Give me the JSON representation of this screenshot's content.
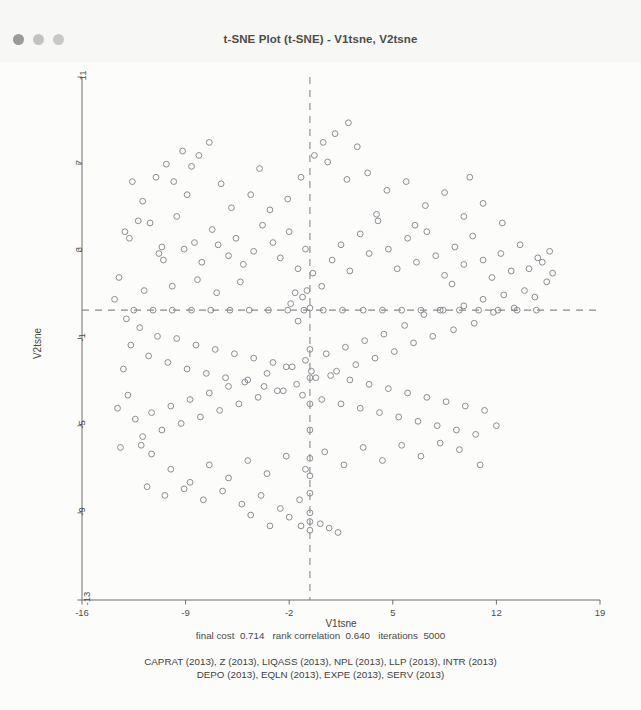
{
  "window": {
    "title": "t-SNE Plot (t-SNE) - V1tsne, V2tsne",
    "traffic_lights": [
      "close",
      "minimize",
      "zoom"
    ]
  },
  "chart_data": {
    "type": "scatter",
    "title": "t-SNE Plot (t-SNE) - V1tsne, V2tsne",
    "xlabel": "V1tsne",
    "ylabel": "V2tsne",
    "xlim": [
      -16,
      19
    ],
    "ylim": [
      -13,
      11
    ],
    "xticks": [
      -16,
      -9,
      -2,
      5,
      12,
      19
    ],
    "yticks": [
      -13,
      -9,
      -5,
      -1,
      3,
      7,
      11
    ],
    "xtick_labels": [
      "-16",
      "-9",
      "-2",
      "5",
      "12",
      "19"
    ],
    "ytick_labels": [
      "-13",
      "-9",
      "-5",
      "-1",
      "3",
      "7",
      "11"
    ],
    "grid": false,
    "legend": "none",
    "marker": "open-circle",
    "marker_color": "#8d8d94",
    "marker_size": 4.6,
    "reference_lines": [
      {
        "orientation": "vertical",
        "value": -0.6,
        "style": "dashed",
        "color": "#8a8a8a"
      },
      {
        "orientation": "horizontal",
        "value": 0.3,
        "style": "dashed",
        "color": "#8a8a8a"
      }
    ],
    "points": [
      [
        -12.6,
        6.2
      ],
      [
        -11.9,
        5.3
      ],
      [
        -12.2,
        4.4
      ],
      [
        -11.4,
        4.3
      ],
      [
        -13.1,
        3.9
      ],
      [
        -12.8,
        3.6
      ],
      [
        -11.0,
        6.4
      ],
      [
        -10.3,
        7.0
      ],
      [
        -9.8,
        6.2
      ],
      [
        -9.2,
        7.6
      ],
      [
        -8.6,
        6.9
      ],
      [
        -8.1,
        7.4
      ],
      [
        -7.4,
        8.0
      ],
      [
        -8.9,
        5.6
      ],
      [
        -9.6,
        4.6
      ],
      [
        -10.6,
        3.2
      ],
      [
        -10.8,
        2.9
      ],
      [
        -10.5,
        2.6
      ],
      [
        -9.1,
        3.1
      ],
      [
        -8.4,
        3.4
      ],
      [
        -7.9,
        2.5
      ],
      [
        -7.2,
        4.0
      ],
      [
        -6.8,
        3.3
      ],
      [
        -6.1,
        2.8
      ],
      [
        -5.6,
        3.6
      ],
      [
        -5.1,
        2.4
      ],
      [
        -4.4,
        3.0
      ],
      [
        -3.8,
        4.2
      ],
      [
        -3.1,
        3.4
      ],
      [
        -2.6,
        2.7
      ],
      [
        -2.0,
        3.9
      ],
      [
        -1.4,
        2.2
      ],
      [
        -0.9,
        3.1
      ],
      [
        -0.6,
        0.4
      ],
      [
        -0.8,
        1.2
      ],
      [
        -1.1,
        0.9
      ],
      [
        -1.6,
        1.1
      ],
      [
        -1.9,
        0.6
      ],
      [
        -0.4,
        2.0
      ],
      [
        0.2,
        1.4
      ],
      [
        0.9,
        2.6
      ],
      [
        1.5,
        3.3
      ],
      [
        2.1,
        2.1
      ],
      [
        2.8,
        3.8
      ],
      [
        3.4,
        2.9
      ],
      [
        4.0,
        4.4
      ],
      [
        4.7,
        3.1
      ],
      [
        5.3,
        2.2
      ],
      [
        6.0,
        3.6
      ],
      [
        6.6,
        2.5
      ],
      [
        7.3,
        3.9
      ],
      [
        7.9,
        2.8
      ],
      [
        8.5,
        1.9
      ],
      [
        9.2,
        3.2
      ],
      [
        9.8,
        2.4
      ],
      [
        10.4,
        3.7
      ],
      [
        11.1,
        2.6
      ],
      [
        11.7,
        1.8
      ],
      [
        12.3,
        2.9
      ],
      [
        13.0,
        2.1
      ],
      [
        13.6,
        3.3
      ],
      [
        14.2,
        2.2
      ],
      [
        14.8,
        2.7
      ],
      [
        15.1,
        2.5
      ],
      [
        15.4,
        1.6
      ],
      [
        14.6,
        0.9
      ],
      [
        13.9,
        1.2
      ],
      [
        13.2,
        0.4
      ],
      [
        12.5,
        1.0
      ],
      [
        11.8,
        0.2
      ],
      [
        11.1,
        0.8
      ],
      [
        10.5,
        -0.3
      ],
      [
        9.8,
        0.5
      ],
      [
        9.1,
        -0.6
      ],
      [
        8.4,
        0.3
      ],
      [
        7.7,
        -0.9
      ],
      [
        7.1,
        0.1
      ],
      [
        6.4,
        -1.2
      ],
      [
        5.8,
        -0.4
      ],
      [
        5.1,
        -1.6
      ],
      [
        4.4,
        -0.8
      ],
      [
        3.8,
        -1.9
      ],
      [
        3.1,
        -1.1
      ],
      [
        2.5,
        -2.2
      ],
      [
        1.8,
        -1.4
      ],
      [
        1.2,
        -2.5
      ],
      [
        0.5,
        -1.7
      ],
      [
        -0.2,
        -2.8
      ],
      [
        -0.9,
        -2.0
      ],
      [
        -1.5,
        -3.1
      ],
      [
        -2.2,
        -2.3
      ],
      [
        -2.8,
        -3.4
      ],
      [
        -3.5,
        -2.6
      ],
      [
        -4.1,
        -3.7
      ],
      [
        -4.8,
        -2.9
      ],
      [
        -5.4,
        -4.0
      ],
      [
        -6.1,
        -3.2
      ],
      [
        -6.7,
        -4.3
      ],
      [
        -7.4,
        -3.5
      ],
      [
        -8.0,
        -4.6
      ],
      [
        -8.7,
        -3.8
      ],
      [
        -9.3,
        -4.9
      ],
      [
        -10.0,
        -4.1
      ],
      [
        -10.6,
        -5.2
      ],
      [
        -11.3,
        -4.4
      ],
      [
        -11.9,
        -5.5
      ],
      [
        -12.4,
        -4.7
      ],
      [
        -12.9,
        -3.6
      ],
      [
        -13.2,
        -2.4
      ],
      [
        -12.7,
        -1.3
      ],
      [
        -12.1,
        -0.5
      ],
      [
        -11.5,
        -1.8
      ],
      [
        -10.9,
        -0.9
      ],
      [
        -10.2,
        -2.1
      ],
      [
        -9.6,
        -1.0
      ],
      [
        -8.9,
        -2.4
      ],
      [
        -8.3,
        -1.3
      ],
      [
        -7.6,
        -2.6
      ],
      [
        -7.0,
        -1.5
      ],
      [
        -6.3,
        -2.8
      ],
      [
        -5.7,
        -1.7
      ],
      [
        -5.0,
        -3.0
      ],
      [
        -4.4,
        -1.9
      ],
      [
        -3.7,
        -3.2
      ],
      [
        -3.1,
        -2.1
      ],
      [
        -2.4,
        -3.4
      ],
      [
        -1.8,
        -2.3
      ],
      [
        -1.1,
        -3.6
      ],
      [
        -0.5,
        -2.5
      ],
      [
        0.2,
        -3.8
      ],
      [
        0.8,
        -2.7
      ],
      [
        1.5,
        -4.0
      ],
      [
        2.1,
        -2.9
      ],
      [
        2.8,
        -4.2
      ],
      [
        3.4,
        -3.1
      ],
      [
        4.1,
        -4.4
      ],
      [
        4.7,
        -3.3
      ],
      [
        5.4,
        -4.6
      ],
      [
        6.0,
        -3.5
      ],
      [
        6.7,
        -4.8
      ],
      [
        7.3,
        -3.7
      ],
      [
        8.0,
        -5.0
      ],
      [
        8.6,
        -3.9
      ],
      [
        9.3,
        -5.2
      ],
      [
        9.9,
        -4.1
      ],
      [
        10.6,
        -5.4
      ],
      [
        11.2,
        -4.3
      ],
      [
        9.5,
        -6.1
      ],
      [
        8.2,
        -5.8
      ],
      [
        6.9,
        -6.4
      ],
      [
        5.6,
        -5.9
      ],
      [
        4.3,
        -6.6
      ],
      [
        3.0,
        -6.0
      ],
      [
        1.7,
        -6.8
      ],
      [
        0.4,
        -6.2
      ],
      [
        -0.9,
        -7.0
      ],
      [
        -2.2,
        -6.4
      ],
      [
        -3.5,
        -7.2
      ],
      [
        -4.8,
        -6.6
      ],
      [
        -6.1,
        -7.4
      ],
      [
        -7.4,
        -6.8
      ],
      [
        -8.7,
        -7.6
      ],
      [
        -10.0,
        -7.0
      ],
      [
        -11.3,
        -6.3
      ],
      [
        -12.0,
        -5.9
      ],
      [
        -11.6,
        -7.8
      ],
      [
        -10.4,
        -8.2
      ],
      [
        -9.1,
        -7.9
      ],
      [
        -7.8,
        -8.4
      ],
      [
        -6.5,
        -8.0
      ],
      [
        -5.2,
        -8.6
      ],
      [
        -3.9,
        -8.2
      ],
      [
        -2.6,
        -8.8
      ],
      [
        -1.3,
        -8.4
      ],
      [
        -0.6,
        -9.0
      ],
      [
        -0.6,
        -9.4
      ],
      [
        -0.6,
        -9.8
      ],
      [
        -1.2,
        -9.6
      ],
      [
        0.1,
        -9.5
      ],
      [
        0.7,
        -9.7
      ],
      [
        1.3,
        -9.9
      ],
      [
        -2.0,
        -9.2
      ],
      [
        -3.3,
        -9.6
      ],
      [
        -4.6,
        -9.1
      ],
      [
        -0.6,
        -8.1
      ],
      [
        -0.6,
        -7.3
      ],
      [
        -0.6,
        -6.5
      ],
      [
        -0.6,
        -5.2
      ],
      [
        -0.6,
        -4.0
      ],
      [
        -0.6,
        -2.8
      ],
      [
        -0.6,
        -1.5
      ],
      [
        -1.4,
        -0.2
      ],
      [
        -2.1,
        0.3
      ],
      [
        -1.0,
        0.3
      ],
      [
        0.3,
        0.3
      ],
      [
        1.6,
        0.3
      ],
      [
        3.0,
        0.3
      ],
      [
        4.3,
        0.3
      ],
      [
        -3.4,
        0.3
      ],
      [
        -4.7,
        0.3
      ],
      [
        -6.0,
        0.3
      ],
      [
        -7.3,
        0.3
      ],
      [
        -8.6,
        0.3
      ],
      [
        -9.9,
        0.3
      ],
      [
        -11.2,
        0.3
      ],
      [
        -12.5,
        0.3
      ],
      [
        5.6,
        0.3
      ],
      [
        6.9,
        0.3
      ],
      [
        8.2,
        0.3
      ],
      [
        9.5,
        0.3
      ],
      [
        10.8,
        0.3
      ],
      [
        12.1,
        0.3
      ],
      [
        13.4,
        0.3
      ],
      [
        14.7,
        0.3
      ],
      [
        -13.5,
        1.8
      ],
      [
        -13.8,
        0.8
      ],
      [
        -13.0,
        -0.1
      ],
      [
        15.8,
        2.0
      ],
      [
        15.6,
        3.0
      ],
      [
        -5.9,
        5.0
      ],
      [
        -4.6,
        5.6
      ],
      [
        -3.3,
        4.9
      ],
      [
        -2.1,
        5.4
      ],
      [
        -6.6,
        6.1
      ],
      [
        -4.0,
        6.8
      ],
      [
        -1.2,
        6.4
      ],
      [
        0.6,
        7.1
      ],
      [
        1.9,
        6.3
      ],
      [
        2.6,
        7.8
      ],
      [
        3.3,
        6.6
      ],
      [
        1.1,
        8.4
      ],
      [
        2.0,
        8.9
      ],
      [
        0.3,
        8.0
      ],
      [
        -0.3,
        7.4
      ],
      [
        4.6,
        5.8
      ],
      [
        5.9,
        6.2
      ],
      [
        7.2,
        5.1
      ],
      [
        8.5,
        5.7
      ],
      [
        9.8,
        4.6
      ],
      [
        11.1,
        5.2
      ],
      [
        12.4,
        4.3
      ],
      [
        6.5,
        4.2
      ],
      [
        3.9,
        4.7
      ],
      [
        10.2,
        6.4
      ],
      [
        -9.9,
        1.4
      ],
      [
        -8.2,
        1.7
      ],
      [
        -6.9,
        1.1
      ],
      [
        -5.3,
        1.6
      ],
      [
        -11.8,
        1.2
      ],
      [
        9.0,
        1.5
      ],
      [
        10.9,
        -6.8
      ],
      [
        12.0,
        -5.0
      ],
      [
        -13.4,
        -6.0
      ],
      [
        -13.6,
        -4.2
      ]
    ]
  },
  "caption": {
    "stat_line": "final cost  0.714   rank correlation  0.640   iterations  5000",
    "variable_lines": [
      "CAPRAT (2013), Z (2013), LIQASS (2013), NPL (2013), LLP (2013), INTR (2013)",
      "DEPO (2013), EQLN (2013), EXPE (2013), SERV (2013)"
    ]
  }
}
